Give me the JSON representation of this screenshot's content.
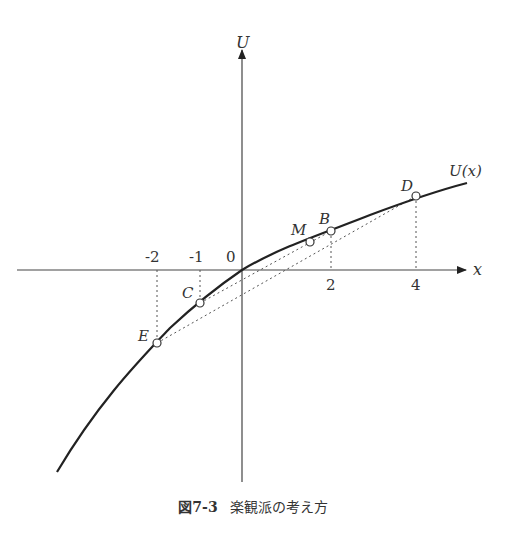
{
  "figure": {
    "caption_number": "図7-3",
    "caption_text": "楽観派の考え方",
    "axes": {
      "x_label": "x",
      "y_label": "U",
      "origin_label": "0",
      "x_ticks": [
        {
          "value": -2,
          "label": "-2"
        },
        {
          "value": -1,
          "label": "-1"
        },
        {
          "value": 2,
          "label": "2"
        },
        {
          "value": 4,
          "label": "4"
        }
      ]
    },
    "curve_label": "U(x)",
    "points": [
      {
        "name": "E",
        "x": -2
      },
      {
        "name": "C",
        "x": -1
      },
      {
        "name": "M",
        "x": 1.5
      },
      {
        "name": "B",
        "x": 2
      },
      {
        "name": "D",
        "x": 4
      }
    ],
    "colors": {
      "curve": "#222222",
      "axis": "#444444",
      "dashed": "#555555"
    }
  }
}
